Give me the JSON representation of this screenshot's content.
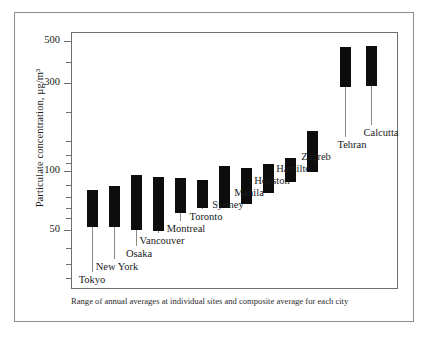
{
  "figure": {
    "caption": "Range of annual averages at individual sites and composite average for each city",
    "y_axis_title": "Particulate concentration, µg/m³"
  },
  "axis": {
    "tick_labels": [
      "500",
      "300",
      "100",
      "50"
    ]
  },
  "chart_data": {
    "type": "bar",
    "title": "",
    "subtitle": "",
    "caption": "Range of annual averages at individual sites and composite average for each city",
    "xlabel": "",
    "ylabel": "Particulate concentration, µg/m³",
    "yscale": "log",
    "ylim": [
      30,
      620
    ],
    "ytick_values": [
      500,
      300,
      100,
      50
    ],
    "ytick_labels": [
      "500",
      "300",
      "100",
      "50"
    ],
    "grid": false,
    "legend": null,
    "value_unit": "µg/m³",
    "series_description": "Vertical black bar spans the range of annual average particulate concentrations across individual sampling sites in each city.",
    "categories": [
      "Tokyo",
      "New York",
      "Osaka",
      "Vancouver",
      "Montreal",
      "Toronto",
      "Sydney",
      "Manila",
      "Houston",
      "Hamilton",
      "Zagreb",
      "Tehran",
      "Calcutta"
    ],
    "ranges": [
      {
        "city": "Tokyo",
        "low": 52,
        "high": 78
      },
      {
        "city": "New York",
        "low": 52,
        "high": 85
      },
      {
        "city": "Osaka",
        "low": 50,
        "high": 103
      },
      {
        "city": "Vancouver",
        "low": 49,
        "high": 99
      },
      {
        "city": "Montreal",
        "low": 62,
        "high": 98
      },
      {
        "city": "Toronto",
        "low": 66,
        "high": 96
      },
      {
        "city": "Sydney",
        "low": 66,
        "high": 115
      },
      {
        "city": "Manila",
        "low": 70,
        "high": 113
      },
      {
        "city": "Houston",
        "low": 84,
        "high": 118
      },
      {
        "city": "Hamilton",
        "low": 98,
        "high": 128
      },
      {
        "city": "Zagreb",
        "low": 112,
        "high": 187
      },
      {
        "city": "Tehran",
        "low": 290,
        "high": 470
      },
      {
        "city": "Calcutta",
        "low": 293,
        "high": 478
      }
    ]
  },
  "cities": [
    {
      "name": "Tokyo",
      "cx": 92,
      "top": 190,
      "bottom": 227,
      "leader_end": 272,
      "label_x": 92,
      "label_y": 274
    },
    {
      "name": "New York",
      "cx": 114,
      "top": 186,
      "bottom": 227,
      "leader_end": 259,
      "label_x": 117,
      "label_y": 261
    },
    {
      "name": "Osaka",
      "cx": 136,
      "top": 175,
      "bottom": 230,
      "leader_end": 246,
      "label_x": 139,
      "label_y": 248
    },
    {
      "name": "Vancouver",
      "cx": 158,
      "top": 177,
      "bottom": 231,
      "leader_end": 233,
      "label_x": 162,
      "label_y": 235
    },
    {
      "name": "Montreal",
      "cx": 180,
      "top": 178,
      "bottom": 213,
      "leader_end": 221,
      "label_x": 186,
      "label_y": 223
    },
    {
      "name": "Toronto",
      "cx": 202,
      "top": 180,
      "bottom": 208,
      "leader_end": 209,
      "label_x": 206,
      "label_y": 211
    },
    {
      "name": "Sydney",
      "cx": 224,
      "top": 166,
      "bottom": 208,
      "leader_end": 197,
      "label_x": 228,
      "label_y": 199
    },
    {
      "name": "Manila",
      "cx": 246,
      "top": 168,
      "bottom": 204,
      "leader_end": 185,
      "label_x": 249,
      "label_y": 187
    },
    {
      "name": "Houston",
      "cx": 268,
      "top": 164,
      "bottom": 193,
      "leader_end": 173,
      "label_x": 272,
      "label_y": 175
    },
    {
      "name": "Hamilton",
      "cx": 290,
      "top": 158,
      "bottom": 182,
      "leader_end": 161,
      "label_x": 296,
      "label_y": 163
    },
    {
      "name": "Zagreb",
      "cx": 312,
      "top": 131,
      "bottom": 172,
      "leader_end": 149,
      "label_x": 316,
      "label_y": 151
    },
    {
      "name": "Tehran",
      "cx": 345,
      "top": 47,
      "bottom": 87,
      "leader_end": 137,
      "label_x": 352,
      "label_y": 139
    },
    {
      "name": "Calcutta",
      "cx": 371,
      "top": 46,
      "bottom": 86,
      "leader_end": 125,
      "label_x": 381,
      "label_y": 127
    }
  ],
  "ticks": {
    "major": [
      {
        "label": "500",
        "y": 41
      },
      {
        "label": "300",
        "y": 83
      },
      {
        "label": "100",
        "y": 171
      },
      {
        "label": "50",
        "y": 230
      }
    ],
    "minor_y": [
      62,
      112,
      141,
      155,
      163,
      185,
      197,
      208,
      218,
      248,
      264,
      278
    ]
  }
}
